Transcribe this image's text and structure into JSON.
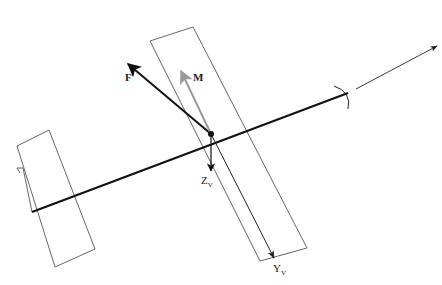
{
  "diagram": {
    "colors": {
      "background": "#ffffff",
      "outline": "#444444",
      "axis": "#111111",
      "force": "#111111",
      "moment": "#9a9a9a"
    },
    "axes": [
      {
        "name": "X",
        "subscript": "V",
        "direction": "forward along fuselage"
      },
      {
        "name": "Y",
        "subscript": "V",
        "direction": "along right wing"
      },
      {
        "name": "Z",
        "subscript": "V",
        "direction": "downward"
      }
    ],
    "vectors": [
      {
        "label": "F",
        "meaning": "force",
        "color": "#111111"
      },
      {
        "label": "M",
        "meaning": "moment",
        "color": "#9a9a9a"
      }
    ],
    "labels": {
      "x_axis": "X",
      "x_sub": "V",
      "y_axis": "Y",
      "y_sub": "V",
      "z_axis": "Z",
      "z_sub": "V",
      "force": "F",
      "moment": "M"
    },
    "components": [
      "fuselage-axis",
      "main-wing",
      "tail-plane",
      "origin-point",
      "rotation-arc"
    ]
  }
}
